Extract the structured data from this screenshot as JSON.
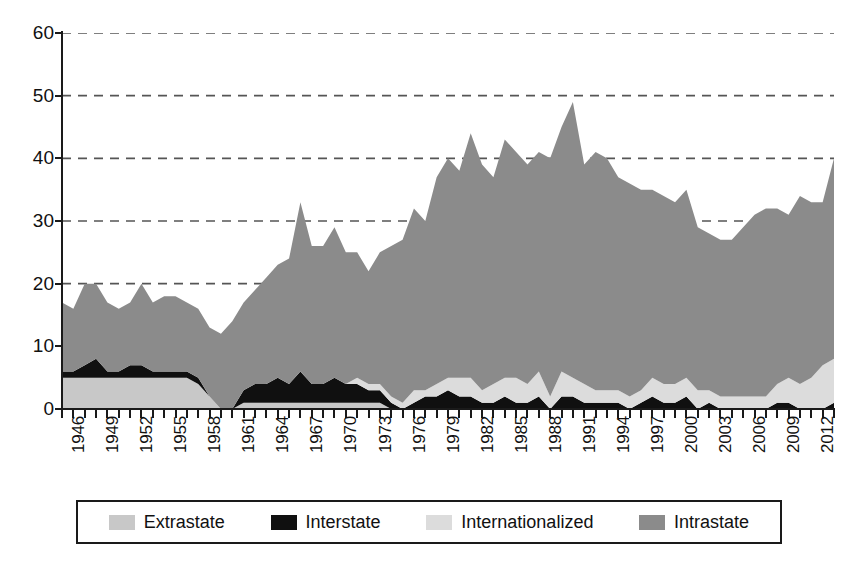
{
  "chart_data": {
    "type": "area",
    "stacked": true,
    "title": "",
    "xlabel": "",
    "ylabel": "",
    "ylim": [
      0,
      60
    ],
    "ytick_values": [
      0,
      10,
      20,
      30,
      40,
      50,
      60
    ],
    "ytick_labels": [
      "0",
      "10",
      "20",
      "30",
      "40",
      "50",
      "60"
    ],
    "xlim": [
      1946,
      2014
    ],
    "xtick_labels": [
      "1946",
      "1947",
      "1948",
      "1949",
      "1950",
      "1951",
      "1952",
      "1953",
      "1954",
      "1955",
      "1956",
      "1957",
      "1958",
      "1959",
      "1960",
      "1961",
      "1962",
      "1963",
      "1964",
      "1965",
      "1966",
      "1967",
      "1968",
      "1969",
      "1970",
      "1971",
      "1972",
      "1973",
      "1974",
      "1975",
      "1976",
      "1977",
      "1978",
      "1979",
      "1980",
      "1981",
      "1982",
      "1983",
      "1984",
      "1985",
      "1986",
      "1987",
      "1988",
      "1989",
      "1990",
      "1991",
      "1992",
      "1993",
      "1994",
      "1995",
      "1996",
      "1997",
      "1998",
      "1999",
      "2000",
      "2001",
      "2002",
      "2003",
      "2004",
      "2005",
      "2006",
      "2007",
      "2008",
      "2009",
      "2010",
      "2011",
      "2012",
      "2013",
      "2014"
    ],
    "xtick_labels_shown": [
      "1946",
      "1949",
      "1952",
      "1955",
      "1958",
      "1961",
      "1964",
      "1967",
      "1970",
      "1973",
      "1976",
      "1979",
      "1982",
      "1985",
      "1988",
      "1991",
      "1994",
      "1997",
      "2000",
      "2003",
      "2006",
      "2009",
      "2012"
    ],
    "xtick_label_interval": 3,
    "xtick_label_rotation": 90,
    "grid": "horizontal-dashed",
    "legend_position": "bottom",
    "x": [
      1946,
      1947,
      1948,
      1949,
      1950,
      1951,
      1952,
      1953,
      1954,
      1955,
      1956,
      1957,
      1958,
      1959,
      1960,
      1961,
      1962,
      1963,
      1964,
      1965,
      1966,
      1967,
      1968,
      1969,
      1970,
      1971,
      1972,
      1973,
      1974,
      1975,
      1976,
      1977,
      1978,
      1979,
      1980,
      1981,
      1982,
      1983,
      1984,
      1985,
      1986,
      1987,
      1988,
      1989,
      1990,
      1991,
      1992,
      1993,
      1994,
      1995,
      1996,
      1997,
      1998,
      1999,
      2000,
      2001,
      2002,
      2003,
      2004,
      2005,
      2006,
      2007,
      2008,
      2009,
      2010,
      2011,
      2012,
      2013,
      2014
    ],
    "series": [
      {
        "name": "Extrastate",
        "color": "#c8c8c8",
        "values": [
          5,
          5,
          5,
          5,
          5,
          5,
          5,
          5,
          5,
          5,
          5,
          5,
          4,
          2,
          0,
          0,
          1,
          1,
          1,
          1,
          1,
          1,
          1,
          1,
          1,
          1,
          1,
          1,
          1,
          0,
          0,
          0,
          0,
          0,
          0,
          0,
          0,
          0,
          0,
          0,
          0,
          0,
          0,
          0,
          0,
          0,
          0,
          0,
          0,
          0,
          0,
          0,
          0,
          0,
          0,
          0,
          0,
          0,
          0,
          0,
          0,
          0,
          0,
          0,
          0,
          0,
          0,
          0,
          0
        ]
      },
      {
        "name": "Interstate",
        "color": "#101010",
        "values": [
          1,
          1,
          2,
          3,
          1,
          1,
          2,
          2,
          1,
          1,
          1,
          1,
          1,
          0,
          0,
          0,
          2,
          3,
          3,
          4,
          3,
          5,
          3,
          3,
          4,
          3,
          3,
          2,
          2,
          1,
          0,
          1,
          2,
          2,
          3,
          2,
          2,
          1,
          1,
          2,
          1,
          1,
          2,
          0,
          2,
          2,
          1,
          1,
          1,
          1,
          0,
          1,
          2,
          1,
          1,
          2,
          0,
          1,
          0,
          0,
          0,
          0,
          0,
          1,
          1,
          0,
          0,
          0,
          1
        ]
      },
      {
        "name": "Internationalized",
        "color": "#dcdcdc",
        "values": [
          0,
          0,
          0,
          0,
          0,
          0,
          0,
          0,
          0,
          0,
          0,
          0,
          0,
          0,
          0,
          0,
          0,
          0,
          0,
          0,
          0,
          0,
          0,
          0,
          0,
          0,
          1,
          1,
          1,
          1,
          1,
          2,
          1,
          2,
          2,
          3,
          3,
          2,
          3,
          3,
          4,
          3,
          4,
          2,
          4,
          3,
          3,
          2,
          2,
          2,
          2,
          2,
          3,
          3,
          3,
          3,
          3,
          2,
          2,
          2,
          2,
          2,
          2,
          3,
          4,
          4,
          5,
          7,
          7
        ]
      },
      {
        "name": "Intrastate",
        "color": "#8b8b8b",
        "values": [
          11,
          10,
          13,
          12,
          11,
          10,
          10,
          13,
          11,
          12,
          12,
          11,
          11,
          11,
          12,
          14,
          14,
          15,
          17,
          18,
          20,
          27,
          22,
          22,
          24,
          21,
          20,
          18,
          21,
          24,
          26,
          29,
          27,
          33,
          35,
          33,
          39,
          36,
          33,
          38,
          36,
          35,
          35,
          38,
          39,
          44,
          35,
          38,
          37,
          34,
          34,
          32,
          30,
          30,
          29,
          30,
          26,
          25,
          25,
          25,
          27,
          29,
          30,
          28,
          26,
          30,
          28,
          26,
          32
        ]
      }
    ],
    "stack_order": [
      "Extrastate",
      "Interstate",
      "Internationalized",
      "Intrastate"
    ]
  },
  "legend": {
    "items": [
      {
        "label": "Extrastate",
        "color": "#c8c8c8"
      },
      {
        "label": "Interstate",
        "color": "#101010"
      },
      {
        "label": "Internationalized",
        "color": "#dcdcdc"
      },
      {
        "label": "Intrastate",
        "color": "#8b8b8b"
      }
    ]
  },
  "axes": {
    "y_labels": [
      "60",
      "50",
      "40",
      "30",
      "20",
      "10",
      "0"
    ]
  }
}
